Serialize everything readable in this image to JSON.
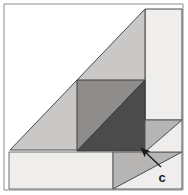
{
  "figure": {
    "name": "geometric-dissection-diagram",
    "width": 188,
    "height": 195,
    "background_color": "#ffffff",
    "annotation": {
      "label": "c",
      "label_x": 162,
      "label_y": 182,
      "arrow_tail_x": 161,
      "arrow_tail_y": 167,
      "arrow_head_x": 142,
      "arrow_head_y": 149,
      "arrow_color": "#1a1a1a"
    },
    "colors": {
      "white": "#ffffff",
      "very_light_gray": "#efeeec",
      "light_gray": "#c9c8c6",
      "medium_gray": "#8e8d8b",
      "dark_gray": "#4b4b4b",
      "outline": "#3c3c3c",
      "frame": "#6e6e6e"
    },
    "shapes": [
      {
        "name": "outer-frame",
        "kind": "rect",
        "points": "4,4 183,4 183,190 4,190",
        "fill": "#ffffff",
        "stroke": "#8d8d8d"
      },
      {
        "name": "right-vertical-panel",
        "kind": "polygon",
        "points": "145,9 182,9 182,120 145,120",
        "fill": "#efeeec",
        "stroke": "#4a4a4a"
      },
      {
        "name": "large-light-triangle",
        "kind": "polygon",
        "points": "10,150 145,9 145,150",
        "fill": "#c9c8c6",
        "stroke": "#4a4a4a"
      },
      {
        "name": "inner-square-upper-triangle",
        "kind": "polygon",
        "points": "77,80 145,80 77,151",
        "fill": "#8e8d8b",
        "stroke": "#3c3c3c"
      },
      {
        "name": "inner-square-lower-triangle",
        "kind": "polygon",
        "points": "145,80 145,151 77,151",
        "fill": "#4b4b4b",
        "stroke": "#3c3c3c"
      },
      {
        "name": "bottom-left-rectangle",
        "kind": "polygon",
        "points": "9,152 113,152 113,189 9,189",
        "fill": "#efeeec",
        "stroke": "#6e6e6e"
      },
      {
        "name": "bottom-right-upper-triangle",
        "kind": "polygon",
        "points": "113,152 182,152 113,189",
        "fill": "#b6b5b3",
        "stroke": "#5a5a5a"
      },
      {
        "name": "bottom-right-lower-triangle",
        "kind": "polygon",
        "points": "182,152 182,189 113,189",
        "fill": "#efeeec",
        "stroke": "#5a5a5a"
      },
      {
        "name": "right-lower-band-triangle",
        "kind": "polygon",
        "points": "145,120 182,120 145,152",
        "fill": "#b6b5b3",
        "stroke": "#5a5a5a"
      },
      {
        "name": "right-lower-band-remainder",
        "kind": "polygon",
        "points": "182,120 182,152 145,152",
        "fill": "#efeeec",
        "stroke": "#5a5a5a"
      }
    ]
  }
}
